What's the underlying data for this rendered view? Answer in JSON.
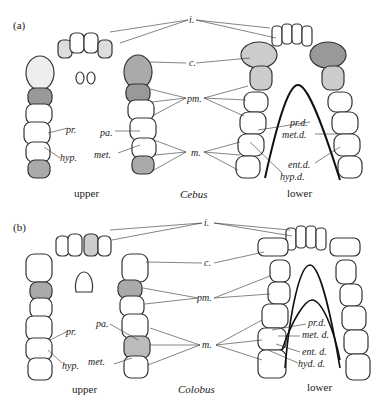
{
  "figure": {
    "panels": [
      {
        "id": "a",
        "panel_label": "(a)",
        "genus": "Cebus",
        "upper_caption": "upper",
        "lower_caption": "lower",
        "center_labels": {
          "incisors": "i.",
          "canine": "c.",
          "premolars": "pm.",
          "molars": "m."
        },
        "upper_cusps": {
          "protocone": "pr.",
          "hypocone": "hyp.",
          "paracone": "pa.",
          "metacone": "met."
        },
        "lower_cusps": {
          "protoconid": "pr.d.",
          "metaconid": "met.d.",
          "entoconid": "ent.d.",
          "hypoconid": "hyp.d."
        }
      },
      {
        "id": "b",
        "panel_label": "(b)",
        "genus": "Colobus",
        "upper_caption": "upper",
        "lower_caption": "lower",
        "center_labels": {
          "incisors": "i.",
          "canine": "c.",
          "premolars": "pm.",
          "molars": "m."
        },
        "upper_cusps": {
          "protocone": "pr.",
          "hypocone": "hyp.",
          "paracone": "pa.",
          "metacone": "met."
        },
        "lower_cusps": {
          "protoconid": "pr.d.",
          "metaconid": "met. d.",
          "entoconid": "ent. d.",
          "hypoconulid": "hyd. d."
        }
      }
    ]
  }
}
